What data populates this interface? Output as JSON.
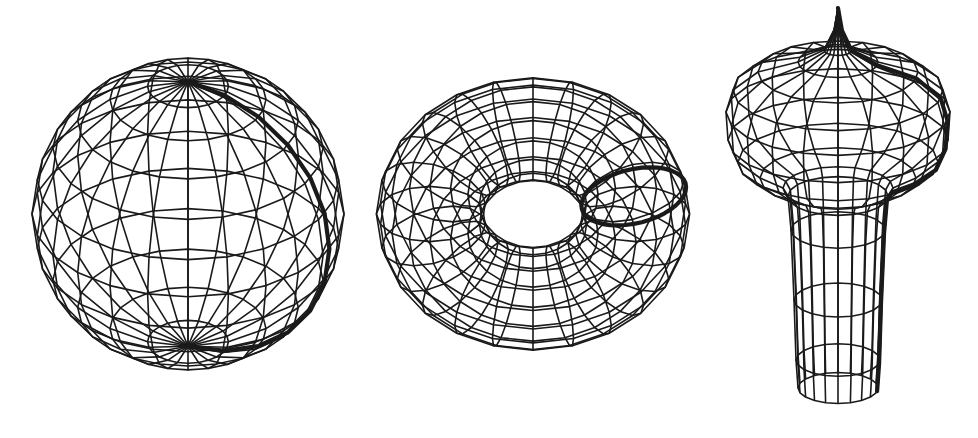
{
  "figure": {
    "background": "#ffffff",
    "line_color": "#1a1a1a",
    "shapes": [
      {
        "id": "sphere",
        "label": "sphere",
        "cx": 188,
        "cy": 214,
        "r": 156,
        "tilt_deg": -32,
        "meridians": 24,
        "parallels": 12,
        "highlight": "meridian"
      },
      {
        "id": "torus",
        "label": "torus",
        "cx": 533,
        "cy": 214,
        "R": 100,
        "r": 52,
        "scale_x": 1.03,
        "tilt_deg": 58,
        "u_segments": 24,
        "v_segments": 16,
        "highlight": "tube-circle"
      },
      {
        "id": "vase",
        "label": "surface-of-revolution",
        "cx": 838,
        "tilt_deg": 14,
        "segments": 20,
        "profile": [
          [
            0,
            8
          ],
          [
            4,
            30
          ],
          [
            14,
            50
          ],
          [
            40,
            62
          ],
          [
            80,
            72
          ],
          [
            105,
            90
          ],
          [
            112,
            112
          ],
          [
            110,
            140
          ],
          [
            100,
            162
          ],
          [
            78,
            178
          ],
          [
            55,
            188
          ],
          [
            50,
            196
          ],
          [
            47,
            230
          ],
          [
            44,
            300
          ],
          [
            42,
            360
          ],
          [
            40,
            388
          ]
        ],
        "highlight": "profile-curve"
      }
    ]
  }
}
